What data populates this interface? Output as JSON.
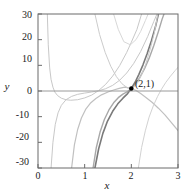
{
  "chart_data": {
    "type": "line",
    "title": "",
    "xlabel": "x",
    "ylabel": "y",
    "xlim": [
      0,
      3
    ],
    "ylim": [
      -30,
      30
    ],
    "xticks": [
      0,
      1,
      2,
      3
    ],
    "yticks": [
      30,
      20,
      10,
      0,
      -10,
      -20,
      -30
    ],
    "grid": false,
    "legend": null,
    "zero_line": {
      "y": 0,
      "color": "#9a9a9a"
    },
    "annotations": [
      {
        "text": "(2,1)",
        "x": 2,
        "y": 1,
        "marker": "filled-circle",
        "color": "#000000"
      }
    ],
    "series": [
      {
        "name": "curve-1",
        "color": "#c8c8c8",
        "width": 1.0,
        "points": [
          [
            0.2,
            30
          ],
          [
            0.22,
            18
          ],
          [
            0.25,
            9
          ],
          [
            0.28,
            4.5
          ],
          [
            0.32,
            1.5
          ],
          [
            0.36,
            -0.4
          ],
          [
            0.42,
            -1.8
          ],
          [
            0.5,
            -2.8
          ],
          [
            0.6,
            -3.4
          ],
          [
            0.7,
            -3.6
          ],
          [
            0.85,
            -3.4
          ],
          [
            1.0,
            -2.7
          ],
          [
            1.15,
            -1.6
          ],
          [
            1.3,
            0.2
          ],
          [
            1.45,
            2.6
          ],
          [
            1.6,
            5.8
          ],
          [
            1.75,
            9.9
          ],
          [
            1.9,
            15.0
          ],
          [
            2.0,
            19.0
          ],
          [
            2.12,
            24.0
          ],
          [
            2.22,
            30
          ]
        ]
      },
      {
        "name": "curve-2",
        "color": "#c8c8c8",
        "width": 1.0,
        "points": [
          [
            0.28,
            -30
          ],
          [
            0.32,
            -20
          ],
          [
            0.37,
            -13
          ],
          [
            0.43,
            -8.5
          ],
          [
            0.5,
            -5.6
          ],
          [
            0.6,
            -3.4
          ],
          [
            0.72,
            -2.1
          ],
          [
            0.85,
            -1.3
          ],
          [
            1.0,
            -0.8
          ],
          [
            1.15,
            -0.4
          ],
          [
            1.3,
            0.1
          ],
          [
            1.45,
            0.9
          ],
          [
            1.6,
            2.2
          ],
          [
            1.75,
            4.2
          ],
          [
            1.9,
            7.0
          ],
          [
            2.05,
            10.7
          ],
          [
            2.2,
            15.4
          ],
          [
            2.35,
            21.2
          ],
          [
            2.48,
            27.0
          ],
          [
            2.55,
            30
          ]
        ]
      },
      {
        "name": "curve-3",
        "color": "#c0c0c0",
        "width": 1.2,
        "points": [
          [
            0.72,
            -30
          ],
          [
            0.78,
            -21
          ],
          [
            0.85,
            -15
          ],
          [
            0.93,
            -10.5
          ],
          [
            1.02,
            -7.2
          ],
          [
            1.12,
            -4.8
          ],
          [
            1.24,
            -2.9
          ],
          [
            1.36,
            -1.5
          ],
          [
            1.5,
            -0.4
          ],
          [
            1.62,
            0.4
          ],
          [
            1.74,
            1.0
          ],
          [
            1.86,
            1.5
          ],
          [
            2.0,
            1.0
          ],
          [
            2.1,
            0.2
          ],
          [
            2.2,
            -1.0
          ],
          [
            2.32,
            -2.6
          ],
          [
            2.45,
            -4.5
          ],
          [
            2.58,
            -6.7
          ],
          [
            2.72,
            -9.3
          ],
          [
            2.85,
            -12.1
          ],
          [
            3.0,
            -15.4
          ]
        ]
      },
      {
        "name": "curve-4",
        "color": "#a8a8a8",
        "width": 1.4,
        "points": [
          [
            1.18,
            -30
          ],
          [
            1.25,
            -22
          ],
          [
            1.33,
            -16
          ],
          [
            1.42,
            -11.2
          ],
          [
            1.52,
            -7.4
          ],
          [
            1.62,
            -4.6
          ],
          [
            1.72,
            -2.6
          ],
          [
            1.82,
            -1.2
          ],
          [
            1.92,
            -0.2
          ],
          [
            2.0,
            1.0
          ],
          [
            2.08,
            2.6
          ],
          [
            2.18,
            5.2
          ],
          [
            2.28,
            8.6
          ],
          [
            2.38,
            12.7
          ],
          [
            2.48,
            17.6
          ],
          [
            2.58,
            23.2
          ],
          [
            2.66,
            28.0
          ],
          [
            2.7,
            30
          ]
        ]
      },
      {
        "name": "curve-5",
        "color": "#7a7a7a",
        "width": 1.6,
        "points": [
          [
            1.22,
            -30
          ],
          [
            1.3,
            -22.5
          ],
          [
            1.39,
            -16.5
          ],
          [
            1.49,
            -11.7
          ],
          [
            1.6,
            -7.9
          ],
          [
            1.71,
            -5.0
          ],
          [
            1.82,
            -2.8
          ],
          [
            1.92,
            -1.0
          ],
          [
            2.0,
            1.0
          ],
          [
            2.08,
            3.4
          ],
          [
            2.16,
            6.4
          ],
          [
            2.25,
            10.2
          ],
          [
            2.34,
            14.6
          ],
          [
            2.43,
            19.6
          ],
          [
            2.52,
            25.2
          ],
          [
            2.58,
            30
          ]
        ]
      },
      {
        "name": "curve-6",
        "color": "#d2d2d2",
        "width": 1.0,
        "points": [
          [
            2.15,
            -30
          ],
          [
            2.22,
            -22
          ],
          [
            2.3,
            -15.5
          ],
          [
            2.38,
            -10.2
          ],
          [
            2.47,
            -5.8
          ],
          [
            2.56,
            -2.2
          ],
          [
            2.65,
            0.8
          ],
          [
            2.74,
            3.4
          ],
          [
            2.84,
            5.8
          ],
          [
            2.94,
            8.0
          ],
          [
            3.0,
            9.2
          ]
        ]
      },
      {
        "name": "curve-7",
        "color": "#cccccc",
        "width": 1.0,
        "points": [
          [
            1.22,
            30
          ],
          [
            1.32,
            22
          ],
          [
            1.44,
            15
          ],
          [
            1.56,
            9.6
          ],
          [
            1.68,
            5.6
          ],
          [
            1.8,
            2.8
          ],
          [
            1.92,
            1.2
          ],
          [
            2.0,
            1.0
          ],
          [
            2.06,
            1.6
          ],
          [
            2.14,
            3.4
          ],
          [
            2.22,
            6.4
          ],
          [
            2.31,
            10.6
          ],
          [
            2.4,
            16.0
          ],
          [
            2.49,
            22.4
          ],
          [
            2.57,
            30
          ]
        ]
      },
      {
        "name": "curve-8",
        "color": "#d8d8d8",
        "width": 1.0,
        "points": [
          [
            1.62,
            30
          ],
          [
            1.72,
            24
          ],
          [
            1.84,
            19.2
          ],
          [
            1.98,
            18.0
          ],
          [
            2.1,
            20.0
          ],
          [
            2.2,
            23.2
          ],
          [
            2.3,
            27.4
          ],
          [
            2.36,
            30
          ]
        ]
      }
    ]
  },
  "axis": {
    "x_tick_labels": [
      "0",
      "1",
      "2",
      "3"
    ],
    "y_tick_labels": [
      "30",
      "20",
      "10",
      "0",
      "-10",
      "-20",
      "-30"
    ],
    "x_axis_title": "x",
    "y_axis_title": "y"
  },
  "annotation": {
    "point_label": "(2,1)"
  }
}
